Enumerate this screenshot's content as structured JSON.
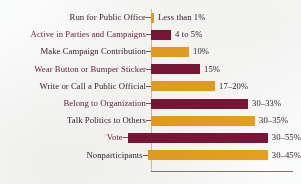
{
  "chart_data": {
    "type": "bar",
    "orientation": "horizontal",
    "title": "",
    "subtitle": "",
    "xlabel": "",
    "ylabel": "",
    "grid": false,
    "legend": "none",
    "xlim": [
      0,
      55
    ],
    "categories": [
      "Run for Public Office",
      "Active in Parties and Campaigns",
      "Make Campaign Contribution",
      "Wear Button or Bumper Sticker",
      "Write or Call a Public Official",
      "Belong to Organization",
      "Talk Politics to Others",
      "Vote",
      "Nonparticipants"
    ],
    "values": [
      1,
      5,
      10,
      15,
      20,
      33,
      35,
      55,
      45
    ],
    "value_labels": [
      "Less than 1%",
      "4 to 5%",
      "10%",
      "15%",
      "17–20%",
      "30–33%",
      "30–35%",
      "30–55%",
      "30–45%"
    ],
    "bar_colors": [
      "#e8a020",
      "#7b1538",
      "#e8a020",
      "#7b1538",
      "#e8a020",
      "#7b1538",
      "#e8a020",
      "#7b1538",
      "#e8a020"
    ],
    "bar_pixel_widths": [
      3,
      20,
      38,
      49,
      64,
      97,
      104,
      140,
      120
    ],
    "colors": {
      "maroon": "#7b1538",
      "orange": "#e8a020",
      "label_dark": "#3a2030",
      "label_accent": "#6d2040",
      "axis": "#8a7060",
      "background": "#fbfcfc"
    }
  }
}
